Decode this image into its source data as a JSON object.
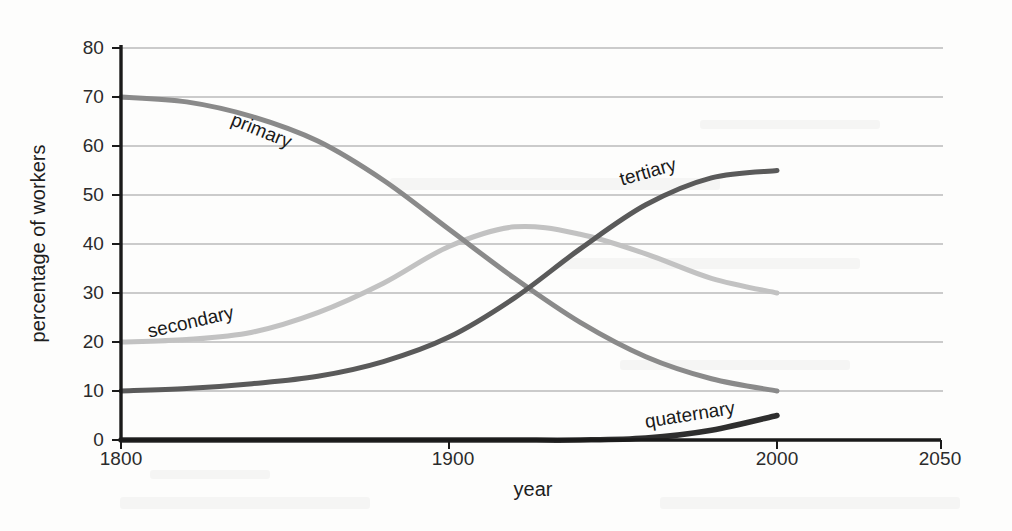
{
  "chart_data": {
    "type": "line",
    "title": "",
    "xlabel": "year",
    "ylabel": "percentage of workers",
    "xlim": [
      1800,
      2050
    ],
    "ylim": [
      0,
      80
    ],
    "grid": true,
    "legend_position": "inline-curve-labels",
    "xticks": [
      "1800",
      "1900",
      "2000",
      "2050"
    ],
    "xtick_values": [
      1800,
      1900,
      2000,
      2050
    ],
    "yticks": [
      "0",
      "10",
      "20",
      "30",
      "40",
      "50",
      "60",
      "70",
      "80"
    ],
    "ytick_values": [
      0,
      10,
      20,
      30,
      40,
      50,
      60,
      70,
      80
    ],
    "x": [
      1800,
      1820,
      1840,
      1860,
      1880,
      1900,
      1920,
      1940,
      1960,
      1980,
      2000
    ],
    "series": [
      {
        "name": "primary",
        "color": "#8a8a8a",
        "label": "primary",
        "values": [
          70,
          69,
          66,
          61,
          53,
          43,
          33,
          24,
          17,
          12.5,
          10
        ]
      },
      {
        "name": "secondary",
        "color": "#c2c2c2",
        "label": "secondary",
        "values": [
          20,
          20.5,
          22,
          26,
          32,
          39.5,
          43.5,
          42,
          38,
          33,
          30
        ]
      },
      {
        "name": "tertiary",
        "color": "#5a5a5a",
        "label": "tertiary",
        "values": [
          10,
          10.5,
          11.5,
          13,
          16,
          21,
          29,
          39,
          48,
          53.5,
          55
        ]
      },
      {
        "name": "quaternary",
        "color": "#2e2e2e",
        "label": "quaternary",
        "values": [
          0,
          0,
          0,
          0,
          0,
          0,
          0,
          0,
          0.4,
          2.0,
          5
        ]
      }
    ]
  },
  "axis": {
    "y_title": "percentage of workers",
    "x_title": "year",
    "y_ticks": [
      "80",
      "70",
      "60",
      "50",
      "40",
      "30",
      "20",
      "10",
      "0"
    ],
    "x_ticks": [
      "1800",
      "1900",
      "2000",
      "2050"
    ]
  },
  "labels": {
    "primary": "primary",
    "secondary": "secondary",
    "tertiary": "tertiary",
    "quaternary": "quaternary"
  },
  "colors": {
    "primary": "#8a8a8a",
    "secondary": "#c2c2c2",
    "tertiary": "#5a5a5a",
    "quaternary": "#2e2e2e",
    "axis": "#1a1a1a",
    "grid": "#9a9a9a",
    "text": "#1e1e1e"
  }
}
